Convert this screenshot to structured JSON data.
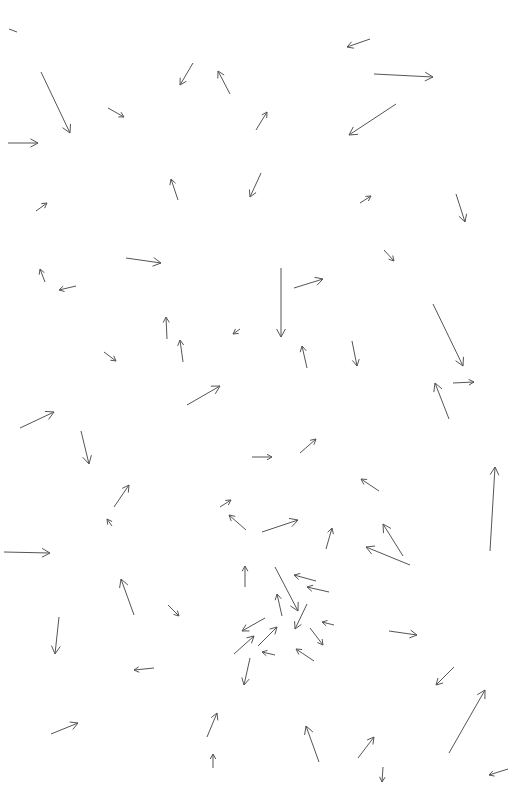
{
  "chart_data": {
    "type": "quiver",
    "title": "",
    "xlabel": "",
    "ylabel": "",
    "grid": false,
    "legend": null,
    "color": "#555555",
    "canvas": {
      "width": 517,
      "height": 795
    },
    "arrows": [
      {
        "x1": 9,
        "y1": 29,
        "x2": 17,
        "y2": 32,
        "head": false
      },
      {
        "x1": 41,
        "y1": 72,
        "x2": 70,
        "y2": 133
      },
      {
        "x1": 8,
        "y1": 143,
        "x2": 38,
        "y2": 143
      },
      {
        "x1": 108,
        "y1": 108,
        "x2": 124,
        "y2": 117
      },
      {
        "x1": 193,
        "y1": 63,
        "x2": 180,
        "y2": 85
      },
      {
        "x1": 230,
        "y1": 94,
        "x2": 218,
        "y2": 71
      },
      {
        "x1": 256,
        "y1": 130,
        "x2": 267,
        "y2": 112
      },
      {
        "x1": 370,
        "y1": 39,
        "x2": 347,
        "y2": 47
      },
      {
        "x1": 374,
        "y1": 74,
        "x2": 433,
        "y2": 77
      },
      {
        "x1": 396,
        "y1": 104,
        "x2": 349,
        "y2": 135
      },
      {
        "x1": 178,
        "y1": 200,
        "x2": 171,
        "y2": 179
      },
      {
        "x1": 261,
        "y1": 173,
        "x2": 250,
        "y2": 197
      },
      {
        "x1": 36,
        "y1": 211,
        "x2": 47,
        "y2": 203
      },
      {
        "x1": 360,
        "y1": 203,
        "x2": 371,
        "y2": 196
      },
      {
        "x1": 456,
        "y1": 194,
        "x2": 465,
        "y2": 222
      },
      {
        "x1": 126,
        "y1": 258,
        "x2": 161,
        "y2": 263
      },
      {
        "x1": 45,
        "y1": 282,
        "x2": 40,
        "y2": 269
      },
      {
        "x1": 76,
        "y1": 286,
        "x2": 59,
        "y2": 290
      },
      {
        "x1": 384,
        "y1": 250,
        "x2": 394,
        "y2": 261
      },
      {
        "x1": 281,
        "y1": 268,
        "x2": 281,
        "y2": 337
      },
      {
        "x1": 294,
        "y1": 288,
        "x2": 323,
        "y2": 279
      },
      {
        "x1": 167,
        "y1": 339,
        "x2": 166,
        "y2": 317
      },
      {
        "x1": 183,
        "y1": 362,
        "x2": 180,
        "y2": 340
      },
      {
        "x1": 240,
        "y1": 329,
        "x2": 233,
        "y2": 334
      },
      {
        "x1": 104,
        "y1": 352,
        "x2": 116,
        "y2": 361
      },
      {
        "x1": 433,
        "y1": 304,
        "x2": 463,
        "y2": 366
      },
      {
        "x1": 352,
        "y1": 341,
        "x2": 357,
        "y2": 366
      },
      {
        "x1": 307,
        "y1": 368,
        "x2": 302,
        "y2": 346
      },
      {
        "x1": 453,
        "y1": 383,
        "x2": 474,
        "y2": 382
      },
      {
        "x1": 449,
        "y1": 419,
        "x2": 435,
        "y2": 383
      },
      {
        "x1": 187,
        "y1": 405,
        "x2": 220,
        "y2": 386
      },
      {
        "x1": 20,
        "y1": 428,
        "x2": 54,
        "y2": 412
      },
      {
        "x1": 81,
        "y1": 431,
        "x2": 89,
        "y2": 464
      },
      {
        "x1": 252,
        "y1": 457,
        "x2": 272,
        "y2": 457
      },
      {
        "x1": 300,
        "y1": 453,
        "x2": 316,
        "y2": 439
      },
      {
        "x1": 114,
        "y1": 507,
        "x2": 129,
        "y2": 485
      },
      {
        "x1": 112,
        "y1": 526,
        "x2": 107,
        "y2": 519
      },
      {
        "x1": 379,
        "y1": 491,
        "x2": 361,
        "y2": 479
      },
      {
        "x1": 490,
        "y1": 551,
        "x2": 495,
        "y2": 467
      },
      {
        "x1": 220,
        "y1": 507,
        "x2": 231,
        "y2": 500
      },
      {
        "x1": 246,
        "y1": 530,
        "x2": 229,
        "y2": 515
      },
      {
        "x1": 262,
        "y1": 532,
        "x2": 298,
        "y2": 520
      },
      {
        "x1": 326,
        "y1": 549,
        "x2": 332,
        "y2": 528
      },
      {
        "x1": 403,
        "y1": 556,
        "x2": 383,
        "y2": 524
      },
      {
        "x1": 410,
        "y1": 565,
        "x2": 366,
        "y2": 547
      },
      {
        "x1": 4,
        "y1": 552,
        "x2": 50,
        "y2": 553
      },
      {
        "x1": 245,
        "y1": 587,
        "x2": 245,
        "y2": 566
      },
      {
        "x1": 275,
        "y1": 567,
        "x2": 298,
        "y2": 611
      },
      {
        "x1": 316,
        "y1": 581,
        "x2": 294,
        "y2": 575
      },
      {
        "x1": 329,
        "y1": 592,
        "x2": 307,
        "y2": 587
      },
      {
        "x1": 134,
        "y1": 615,
        "x2": 121,
        "y2": 579
      },
      {
        "x1": 168,
        "y1": 605,
        "x2": 179,
        "y2": 616
      },
      {
        "x1": 282,
        "y1": 616,
        "x2": 277,
        "y2": 594
      },
      {
        "x1": 307,
        "y1": 604,
        "x2": 295,
        "y2": 629
      },
      {
        "x1": 265,
        "y1": 618,
        "x2": 242,
        "y2": 631
      },
      {
        "x1": 334,
        "y1": 625,
        "x2": 322,
        "y2": 622
      },
      {
        "x1": 310,
        "y1": 628,
        "x2": 323,
        "y2": 645
      },
      {
        "x1": 59,
        "y1": 617,
        "x2": 55,
        "y2": 654
      },
      {
        "x1": 389,
        "y1": 631,
        "x2": 417,
        "y2": 635
      },
      {
        "x1": 234,
        "y1": 654,
        "x2": 254,
        "y2": 636
      },
      {
        "x1": 258,
        "y1": 646,
        "x2": 277,
        "y2": 627
      },
      {
        "x1": 275,
        "y1": 655,
        "x2": 262,
        "y2": 652
      },
      {
        "x1": 314,
        "y1": 661,
        "x2": 296,
        "y2": 649
      },
      {
        "x1": 154,
        "y1": 668,
        "x2": 134,
        "y2": 670
      },
      {
        "x1": 250,
        "y1": 658,
        "x2": 244,
        "y2": 685
      },
      {
        "x1": 454,
        "y1": 667,
        "x2": 436,
        "y2": 685
      },
      {
        "x1": 51,
        "y1": 734,
        "x2": 78,
        "y2": 723
      },
      {
        "x1": 207,
        "y1": 737,
        "x2": 217,
        "y2": 713
      },
      {
        "x1": 319,
        "y1": 762,
        "x2": 306,
        "y2": 726
      },
      {
        "x1": 358,
        "y1": 758,
        "x2": 374,
        "y2": 737
      },
      {
        "x1": 449,
        "y1": 753,
        "x2": 485,
        "y2": 690
      },
      {
        "x1": 213,
        "y1": 768,
        "x2": 213,
        "y2": 754
      },
      {
        "x1": 383,
        "y1": 767,
        "x2": 382,
        "y2": 782
      },
      {
        "x1": 508,
        "y1": 769,
        "x2": 489,
        "y2": 775
      }
    ]
  }
}
